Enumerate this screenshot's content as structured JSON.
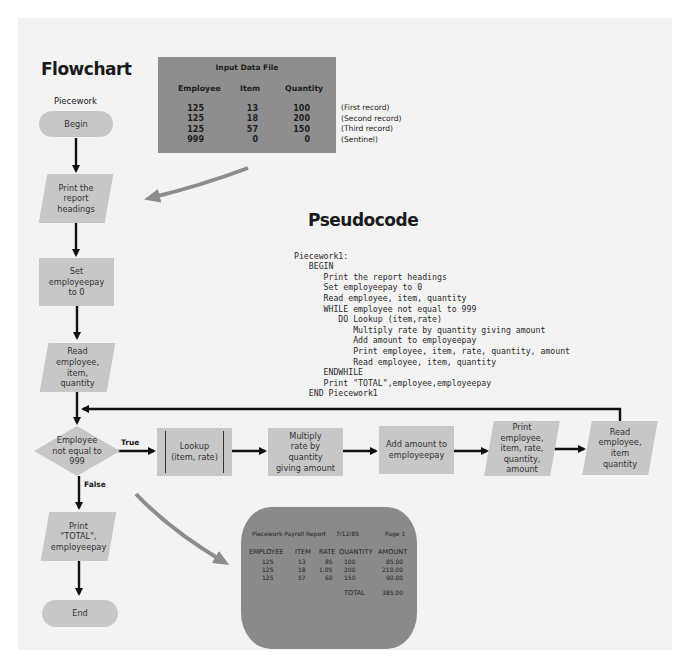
{
  "flowchart": {
    "title": "Flowchart",
    "subtitle": "Piecework",
    "nodes": {
      "begin": "Begin",
      "print_headings": "Print the\nreport\nheadings",
      "set_pay": "Set\nemployeepay\nto 0",
      "read_first": "Read\nemployee,\nitem,\nquantity",
      "decision": "Employee\nnot equal to\n999",
      "lookup": "Lookup\n(item, rate)",
      "multiply": "Multiply\nrate by\nquantity\ngiving amount",
      "add": "Add amount to\nemployeepay",
      "print_detail": "Print\nemployee,\nitem, rate,\nquantity,\namount",
      "read_next": "Read\nemployee,\nitem\nquantity",
      "print_total": "Print\n\"TOTAL\",\nemployeepay",
      "end": "End"
    },
    "branch_labels": {
      "true": "True",
      "false": "False"
    }
  },
  "input_file": {
    "title": "Input Data File",
    "columns": [
      "Employee",
      "Item",
      "Quantity"
    ],
    "rows": [
      [
        "125",
        "13",
        "100"
      ],
      [
        "125",
        "18",
        "200"
      ],
      [
        "125",
        "57",
        "150"
      ],
      [
        "999",
        "0",
        "0"
      ]
    ],
    "notes": [
      "(First record)",
      "(Second record)",
      "(Third record)",
      "(Sentinel)"
    ]
  },
  "pseudocode": {
    "title": "Pseudocode",
    "lines": [
      "Piecework1:",
      "   BEGIN",
      "      Print the report headings",
      "      Set employeepay to 0",
      "      Read employee, item, quantity",
      "      WHILE employee not equal to 999",
      "         DO Lookup (item,rate)",
      "            Multiply rate by quantity giving amount",
      "            Add amount to employeepay",
      "            Print employee, item, rate, quantity, amount",
      "            Read employee, item, quantity",
      "      ENDWHILE",
      "      Print \"TOTAL\",employee,employeepay",
      "   END Piecework1"
    ]
  },
  "report": {
    "title": "Piecework Payroll Report",
    "date": "7/12/85",
    "page": "Page 1",
    "columns": [
      "EMPLOYEE",
      "ITEM",
      "RATE",
      "QUANTITY",
      "AMOUNT"
    ],
    "rows": [
      [
        "125",
        "13",
        "85",
        "100",
        "85.00"
      ],
      [
        "125",
        "18",
        "1.05",
        "200",
        "210.00"
      ],
      [
        "125",
        "57",
        "60",
        "150",
        "90.00"
      ]
    ],
    "total_label": "TOTAL",
    "total_value": "385.00"
  }
}
